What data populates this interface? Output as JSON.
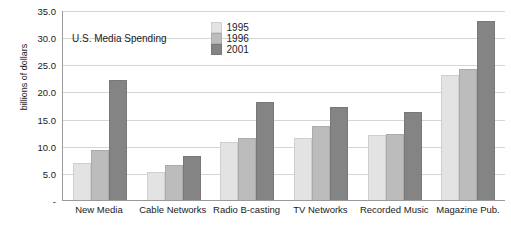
{
  "chart_data": {
    "type": "bar",
    "title": "",
    "xlabel": "",
    "ylabel": "billions of dollars",
    "ylim": [
      0,
      35
    ],
    "ytick_labels": [
      "35.0",
      "30.0",
      "25.0",
      "20.0",
      "15.0",
      "10.0",
      "5.0",
      "-"
    ],
    "ytick_values": [
      35,
      30,
      25,
      20,
      15,
      10,
      5,
      0
    ],
    "grid": true,
    "legend_position": "top-inside",
    "legend_title": "U.S. Media Spending",
    "categories": [
      "New Media",
      "Cable Networks",
      "Radio B-casting",
      "TV Networks",
      "Recorded Music",
      "Magazine Pub."
    ],
    "series": [
      {
        "name": "1995",
        "color": "#e3e3e3",
        "values": [
          6.9,
          5.2,
          10.6,
          11.4,
          12.0,
          23.1
        ]
      },
      {
        "name": "1996",
        "color": "#bcbcbc",
        "values": [
          9.3,
          6.5,
          11.4,
          13.6,
          12.2,
          24.2
        ]
      },
      {
        "name": "2001",
        "color": "#848484",
        "values": [
          22.1,
          8.1,
          18.1,
          17.1,
          16.3,
          33.0
        ]
      }
    ]
  }
}
